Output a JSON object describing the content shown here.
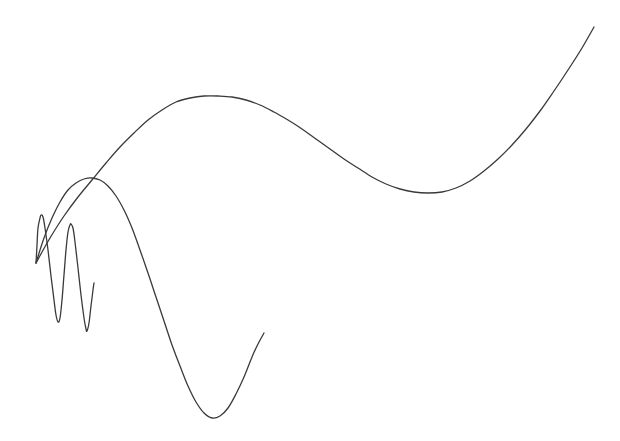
{
  "canvas": {
    "width": 620,
    "height": 441,
    "background": "#ffffff",
    "stroke_color": "#3a3a3a"
  },
  "chart_data": {
    "type": "line",
    "title": "",
    "xlabel": "",
    "ylabel": "",
    "grid": false,
    "legend": null,
    "axes_visible": false,
    "coordinate_space": "screen pixels (origin top-left, y down)",
    "origin_point": [
      36,
      263
    ],
    "series": [
      {
        "name": "large-curve",
        "description": "Long wave: rises to peak, dips to trough, rises to top-right",
        "points": [
          [
            36,
            263
          ],
          [
            50,
            238
          ],
          [
            64,
            216
          ],
          [
            78,
            197
          ],
          [
            92,
            180
          ],
          [
            106,
            163
          ],
          [
            120,
            147
          ],
          [
            134,
            133
          ],
          [
            148,
            120
          ],
          [
            162,
            110
          ],
          [
            176,
            102
          ],
          [
            190,
            98
          ],
          [
            204,
            96
          ],
          [
            218,
            96
          ],
          [
            232,
            97
          ],
          [
            246,
            100
          ],
          [
            260,
            105
          ],
          [
            274,
            112
          ],
          [
            288,
            120
          ],
          [
            302,
            129
          ],
          [
            316,
            139
          ],
          [
            330,
            149
          ],
          [
            344,
            159
          ],
          [
            358,
            168
          ],
          [
            372,
            177
          ],
          [
            386,
            184
          ],
          [
            400,
            189
          ],
          [
            414,
            192
          ],
          [
            428,
            193
          ],
          [
            442,
            192
          ],
          [
            456,
            188
          ],
          [
            470,
            181
          ],
          [
            484,
            171
          ],
          [
            498,
            159
          ],
          [
            512,
            145
          ],
          [
            526,
            129
          ],
          [
            540,
            111
          ],
          [
            554,
            91
          ],
          [
            568,
            70
          ],
          [
            582,
            48
          ],
          [
            594,
            27
          ]
        ]
      },
      {
        "name": "medium-curve",
        "description": "Arc peaking near crossing point then dropping to deep trough and rising",
        "points": [
          [
            36,
            263
          ],
          [
            44,
            238
          ],
          [
            52,
            218
          ],
          [
            60,
            202
          ],
          [
            68,
            190
          ],
          [
            76,
            183
          ],
          [
            84,
            179
          ],
          [
            92,
            178
          ],
          [
            100,
            180
          ],
          [
            108,
            186
          ],
          [
            116,
            196
          ],
          [
            124,
            210
          ],
          [
            132,
            228
          ],
          [
            140,
            250
          ],
          [
            148,
            273
          ],
          [
            156,
            297
          ],
          [
            164,
            321
          ],
          [
            172,
            345
          ],
          [
            180,
            366
          ],
          [
            188,
            386
          ],
          [
            196,
            402
          ],
          [
            204,
            413
          ],
          [
            212,
            418
          ],
          [
            220,
            416
          ],
          [
            228,
            408
          ],
          [
            236,
            394
          ],
          [
            244,
            377
          ],
          [
            252,
            357
          ],
          [
            258,
            344
          ],
          [
            264,
            333
          ]
        ]
      },
      {
        "name": "small-wave",
        "description": "High-frequency oscillation with two full cycles",
        "points": [
          [
            36,
            263
          ],
          [
            37,
            245
          ],
          [
            38,
            228
          ],
          [
            40,
            218
          ],
          [
            41,
            215
          ],
          [
            43,
            217
          ],
          [
            45,
            228
          ],
          [
            48,
            250
          ],
          [
            51,
            276
          ],
          [
            54,
            300
          ],
          [
            56,
            315
          ],
          [
            58,
            322
          ],
          [
            60,
            318
          ],
          [
            62,
            300
          ],
          [
            64,
            275
          ],
          [
            66,
            250
          ],
          [
            68,
            232
          ],
          [
            70,
            225
          ],
          [
            71,
            224
          ],
          [
            73,
            228
          ],
          [
            75,
            242
          ],
          [
            78,
            268
          ],
          [
            81,
            295
          ],
          [
            84,
            318
          ],
          [
            86,
            329
          ],
          [
            87,
            331
          ],
          [
            89,
            323
          ],
          [
            91,
            306
          ],
          [
            93,
            290
          ],
          [
            94,
            283
          ]
        ]
      }
    ]
  }
}
